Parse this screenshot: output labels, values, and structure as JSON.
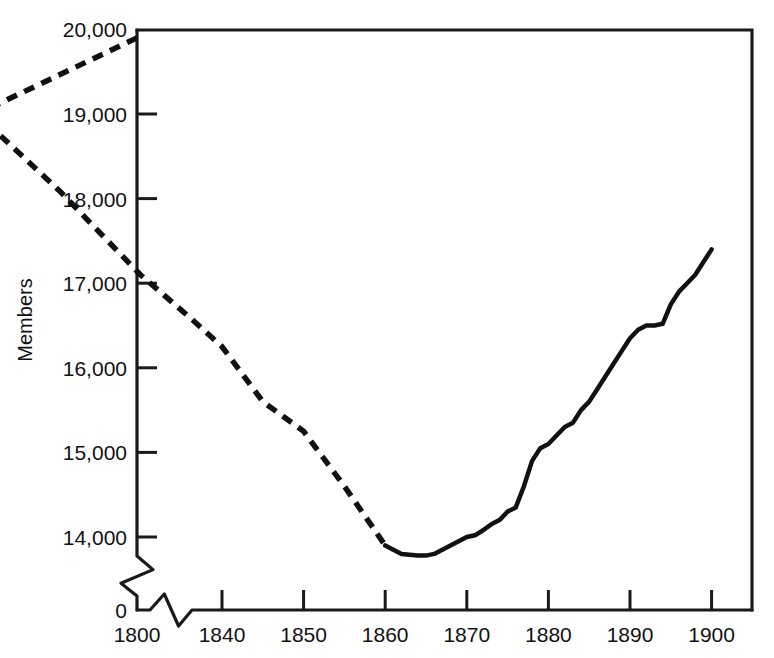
{
  "chart_data": {
    "type": "line",
    "title": "",
    "subtitle": "",
    "xlabel": "",
    "ylabel": "Members",
    "grid": false,
    "legend": false,
    "legend_position": "none",
    "xlim": [
      1840,
      1900
    ],
    "ylim": [
      13500,
      20000
    ],
    "y_axis_break": true,
    "x_axis_break": true,
    "y_break_note": "axis broken between 0 and 14,000",
    "x_break_note": "axis broken between 1800 and 1840",
    "yticks": [
      {
        "value": 20000,
        "label": "20,000"
      },
      {
        "value": 19000,
        "label": "19,000"
      },
      {
        "value": 18000,
        "label": "18,000"
      },
      {
        "value": 17000,
        "label": "17,000"
      },
      {
        "value": 16000,
        "label": "16,000"
      },
      {
        "value": 15000,
        "label": "15,000"
      },
      {
        "value": 14000,
        "label": "14,000"
      },
      {
        "value": 0,
        "label": "0"
      }
    ],
    "xticks": [
      {
        "value": 1800,
        "label": "1800"
      },
      {
        "value": 1840,
        "label": "1840"
      },
      {
        "value": 1850,
        "label": "1850"
      },
      {
        "value": 1860,
        "label": "1860"
      },
      {
        "value": 1870,
        "label": "1870"
      },
      {
        "value": 1880,
        "label": "1880"
      },
      {
        "value": 1890,
        "label": "1890"
      },
      {
        "value": 1900,
        "label": "1900"
      }
    ],
    "series": [
      {
        "name": "Members (estimated)",
        "style": "dashed",
        "x": [
          1800,
          1810,
          1820,
          1830,
          1836,
          1840,
          1845,
          1850,
          1855,
          1860
        ],
        "values": [
          19900,
          19000,
          18100,
          17100,
          16600,
          16250,
          15600,
          15250,
          14600,
          13900
        ]
      },
      {
        "name": "Members (recorded)",
        "style": "solid",
        "x": [
          1860,
          1861,
          1862,
          1863,
          1864,
          1865,
          1866,
          1867,
          1868,
          1869,
          1870,
          1871,
          1872,
          1873,
          1874,
          1875,
          1876,
          1877,
          1878,
          1879,
          1880,
          1881,
          1882,
          1883,
          1884,
          1885,
          1886,
          1887,
          1888,
          1889,
          1890,
          1891,
          1892,
          1893,
          1894,
          1895,
          1896,
          1897,
          1898,
          1899,
          1900
        ],
        "values": [
          13900,
          13850,
          13800,
          13790,
          13780,
          13780,
          13800,
          13850,
          13900,
          13950,
          14000,
          14020,
          14080,
          14150,
          14200,
          14300,
          14350,
          14600,
          14900,
          15050,
          15100,
          15200,
          15300,
          15350,
          15500,
          15600,
          15750,
          15900,
          16050,
          16200,
          16350,
          16450,
          16500,
          16500,
          16520,
          16750,
          16900,
          17000,
          17100,
          17250,
          17400
        ]
      }
    ]
  },
  "geometry": {
    "plot_left": 137,
    "plot_right": 752,
    "plot_top": 30,
    "plot_bottom": 610,
    "y_zero_px": 610,
    "y_14000_px": 537,
    "y_px_per_1000": 84.6,
    "x_1800_px": 137,
    "x_1840_px": 222,
    "x_px_per_year": 8.16,
    "break_gap_x": [
      150,
      192
    ],
    "break_gap_y": [
      556,
      596
    ]
  },
  "style": {
    "line_color": "#111111",
    "axis_color": "#1a1a1a",
    "background": "#ffffff",
    "line_width_solid": 4.5,
    "line_width_dashed": 5.5,
    "dash_pattern": "11 8"
  }
}
